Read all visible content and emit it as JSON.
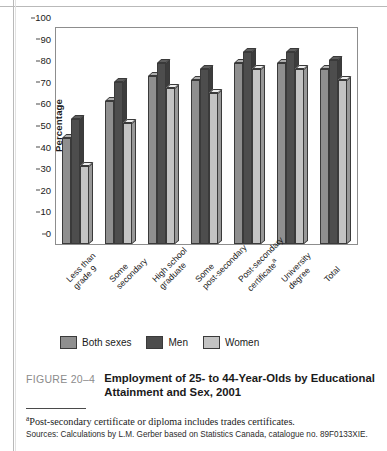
{
  "chart_data": {
    "type": "bar",
    "title": "Employment of 25- to 44-Year-Olds by Educational Attainment and Sex, 2001",
    "xlabel": "",
    "ylabel": "Percentage",
    "ylim": [
      0,
      100
    ],
    "ytick_step": 10,
    "yticks": [
      100,
      90,
      80,
      70,
      60,
      50,
      40,
      30,
      20,
      10,
      0
    ],
    "grid": false,
    "legend_position": "bottom",
    "categories": [
      "Less than grade 9",
      "Some secondary",
      "High school graduate",
      "Some post-secondary",
      "Post-secondary certificate",
      "University degree",
      "Total"
    ],
    "category_lines": [
      [
        "Less than",
        "grade 9"
      ],
      [
        "Some",
        "secondary"
      ],
      [
        "High school",
        "graduate"
      ],
      [
        "Some",
        "post-secondary"
      ],
      [
        "Post-secondary",
        "certificate"
      ],
      [
        "University",
        "degree"
      ],
      [
        "Total",
        ""
      ]
    ],
    "category_footnote_marks": [
      "",
      "",
      "",
      "",
      "a",
      "",
      ""
    ],
    "series": [
      {
        "name": "Both sexes",
        "color": "#8f8f8f",
        "values": [
          49,
          66,
          78,
          76,
          84,
          84,
          81
        ]
      },
      {
        "name": "Men",
        "color": "#4d4d4d",
        "values": [
          58,
          75,
          84,
          81,
          89,
          89,
          85
        ]
      },
      {
        "name": "Women",
        "color": "#c3c3c3",
        "values": [
          36,
          56,
          72,
          70,
          81,
          81,
          76
        ]
      }
    ]
  },
  "figure": {
    "number": "FIGURE 20–4",
    "title": "Employment of 25- to 44-Year-Olds by Educational Attainment and Sex, 2001",
    "footnote_marker": "a",
    "footnote": "Post-secondary certificate or diploma includes trades certificates.",
    "sources": "Sources: Calculations by L.M. Gerber based on Statistics Canada, catalogue no. 89F0133XIE."
  }
}
